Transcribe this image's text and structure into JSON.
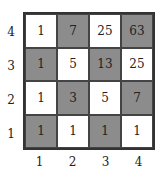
{
  "grid": {
    "rows": [
      {
        "y": "4",
        "cells": [
          {
            "value": "1",
            "shaded": false
          },
          {
            "value": "7",
            "shaded": true
          },
          {
            "value": "25",
            "shaded": false
          },
          {
            "value": "63",
            "shaded": true
          }
        ]
      },
      {
        "y": "3",
        "cells": [
          {
            "value": "1",
            "shaded": true
          },
          {
            "value": "5",
            "shaded": false
          },
          {
            "value": "13",
            "shaded": true
          },
          {
            "value": "25",
            "shaded": false
          }
        ]
      },
      {
        "y": "2",
        "cells": [
          {
            "value": "1",
            "shaded": false
          },
          {
            "value": "3",
            "shaded": true
          },
          {
            "value": "5",
            "shaded": false
          },
          {
            "value": "7",
            "shaded": true
          }
        ]
      },
      {
        "y": "1",
        "cells": [
          {
            "value": "1",
            "shaded": true
          },
          {
            "value": "1",
            "shaded": false
          },
          {
            "value": "1",
            "shaded": true
          },
          {
            "value": "1",
            "shaded": false
          }
        ]
      }
    ],
    "x_labels": [
      "1",
      "2",
      "3",
      "4"
    ],
    "y_labels": [
      "4",
      "3",
      "2",
      "1"
    ]
  },
  "colors": {
    "shaded": "#8c8c8c",
    "plain": "#ffffff",
    "border": "#333333"
  }
}
